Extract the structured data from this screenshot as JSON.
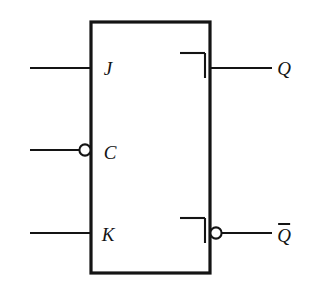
{
  "diagram": {
    "kind": "logic-symbol",
    "background_color": "#ffffff",
    "line_color": "#141414",
    "body": {
      "shape": "rectangle",
      "x": 91,
      "y": 22,
      "width": 119,
      "height": 251,
      "stroke_width": 3.2,
      "fill": "#ffffff"
    },
    "inputs": [
      {
        "id": "j",
        "label": "J",
        "side": "left",
        "y": 68,
        "wire_x_start": 30,
        "wire_x_end": 91,
        "inverted": false,
        "label_x": 108,
        "label_y": 68
      },
      {
        "id": "c",
        "label": "C",
        "side": "left",
        "y": 150,
        "wire_x_start": 30,
        "wire_x_end": 80,
        "inverted": true,
        "bubble_cx": 85,
        "bubble_r": 5.6,
        "label_x": 110,
        "label_y": 152
      },
      {
        "id": "k",
        "label": "K",
        "side": "left",
        "y": 233,
        "wire_x_start": 30,
        "wire_x_end": 91,
        "inverted": false,
        "label_x": 108,
        "label_y": 234
      }
    ],
    "outputs": [
      {
        "id": "q",
        "label": "Q",
        "overbar": false,
        "side": "right",
        "y": 68,
        "wire_x_start": 210,
        "wire_x_end": 272,
        "inverted": false,
        "label_x": 284,
        "label_y": 68
      },
      {
        "id": "q-not",
        "label": "Q",
        "overbar": true,
        "side": "right",
        "y": 233,
        "wire_x_start": 222,
        "wire_x_end": 272,
        "inverted": true,
        "bubble_cx": 216,
        "bubble_r": 5.6,
        "label_x": 284,
        "label_y": 234
      }
    ],
    "edge_markers": [
      {
        "id": "dynamic-indicator-q",
        "name": "edge-trigger-bracket",
        "h_x1": 180,
        "h_x2": 205,
        "h_y": 53,
        "v_x": 205,
        "v_y1": 53,
        "v_y2": 78
      },
      {
        "id": "dynamic-indicator-qnot",
        "name": "edge-trigger-bracket",
        "h_x1": 180,
        "h_x2": 205,
        "h_y": 218,
        "v_x": 205,
        "v_y1": 218,
        "v_y2": 243
      }
    ]
  }
}
